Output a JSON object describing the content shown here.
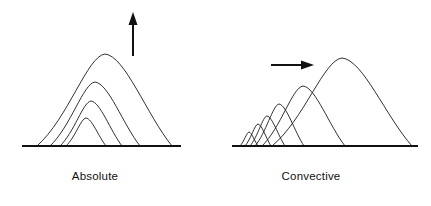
{
  "figure": {
    "background_color": "#ffffff",
    "stroke_color": "#1a1a1a",
    "baseline_color": "#111111",
    "panels": [
      {
        "id": "absolute",
        "caption": "Absolute",
        "caption_x": 95,
        "caption_y": 180,
        "arrow": {
          "name": "upward-arrow",
          "direction": "up",
          "x1": 133,
          "y1": 56,
          "x2": 133,
          "y2": 18,
          "head_points": "133,12 128.5,25 137.5,25"
        },
        "baseline": {
          "x1": 22,
          "y1": 146,
          "x2": 181,
          "y2": 146
        },
        "arches": [
          {
            "index": 1,
            "left": 66,
            "right": 106,
            "apex_x": 86,
            "apex_y": 118
          },
          {
            "index": 2,
            "left": 60,
            "right": 122,
            "apex_x": 91,
            "apex_y": 101
          },
          {
            "index": 3,
            "left": 50,
            "right": 140,
            "apex_x": 95,
            "apex_y": 82
          },
          {
            "index": 4,
            "left": 37,
            "right": 172,
            "apex_x": 105,
            "apex_y": 54
          }
        ]
      },
      {
        "id": "convective",
        "caption": "Convective",
        "caption_x": 311,
        "caption_y": 180,
        "arrow": {
          "name": "rightward-arrow",
          "direction": "right",
          "x1": 271,
          "y1": 65,
          "x2": 307,
          "y2": 65,
          "head_points": "314,65 301,60.5 301,69.5"
        },
        "baseline": {
          "x1": 232,
          "y1": 146,
          "x2": 418,
          "y2": 146
        },
        "arches": [
          {
            "index": 1,
            "left": 240,
            "right": 258,
            "apex_x": 249,
            "apex_y": 132
          },
          {
            "index": 2,
            "left": 245,
            "right": 271,
            "apex_x": 258,
            "apex_y": 124
          },
          {
            "index": 3,
            "left": 250,
            "right": 285,
            "apex_x": 267,
            "apex_y": 116
          },
          {
            "index": 4,
            "left": 255,
            "right": 304,
            "apex_x": 279,
            "apex_y": 104
          },
          {
            "index": 5,
            "left": 262,
            "right": 345,
            "apex_x": 303,
            "apex_y": 86
          },
          {
            "index": 6,
            "left": 272,
            "right": 412,
            "apex_x": 342,
            "apex_y": 58
          }
        ]
      }
    ]
  }
}
